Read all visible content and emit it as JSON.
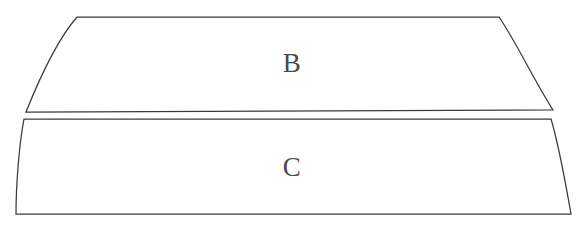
{
  "figure": {
    "background_color": "#ffffff",
    "stroke_color": "#3a3a3a",
    "label_color": "#4a4a4a",
    "stroke_width": 1.25,
    "width": 582,
    "height": 233,
    "shapes": [
      {
        "id": "shape-b",
        "label": "B",
        "label_x": 292,
        "label_y": 66,
        "path": "M 77 17 L 499 17 C 515 40 535 82 553 110 L 26 112 C 38 82 57 40 77 17 Z",
        "corners": {
          "top_left": [
            77,
            17
          ],
          "top_right": [
            499,
            17
          ],
          "bottom_right": [
            553,
            110
          ],
          "bottom_left": [
            26,
            112
          ]
        }
      },
      {
        "id": "shape-c",
        "label": "C",
        "label_x": 292,
        "label_y": 170,
        "path": "M 24 119 L 551 119 C 559 145 566 186 571 214 L 16 214 C 16 186 19 145 24 119 Z",
        "corners": {
          "top_left": [
            24,
            119
          ],
          "top_right": [
            551,
            119
          ],
          "bottom_right": [
            571,
            214
          ],
          "bottom_left": [
            16,
            214
          ]
        }
      }
    ]
  }
}
